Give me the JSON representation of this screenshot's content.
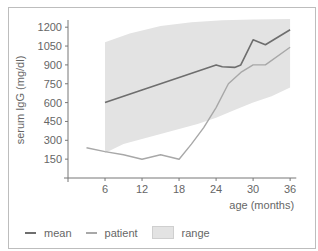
{
  "colors": {
    "mean": "#6e6e6e",
    "patient": "#a8a8a8",
    "range": "#e3e3e3",
    "axis": "#777777",
    "text": "#666666"
  },
  "chart_data": {
    "type": "line",
    "title": "",
    "xlabel": "age (months)",
    "ylabel": "serum IgG (mg/dl)",
    "xlim": [
      0,
      37
    ],
    "ylim": [
      0,
      1250
    ],
    "x_ticks": [
      6,
      12,
      18,
      24,
      30,
      36
    ],
    "y_ticks": [
      150,
      300,
      450,
      600,
      750,
      900,
      1050,
      1200
    ],
    "grid": false,
    "legend_position": "bottom",
    "series": [
      {
        "name": "mean",
        "type": "line",
        "points": [
          [
            6,
            600
          ],
          [
            12,
            700
          ],
          [
            18,
            800
          ],
          [
            24,
            900
          ],
          [
            25,
            885
          ],
          [
            27,
            880
          ],
          [
            28,
            900
          ],
          [
            30,
            1100
          ],
          [
            32,
            1060
          ],
          [
            36,
            1180
          ]
        ]
      },
      {
        "name": "patient",
        "type": "line",
        "points": [
          [
            3,
            240
          ],
          [
            6,
            210
          ],
          [
            9,
            185
          ],
          [
            12,
            150
          ],
          [
            15,
            185
          ],
          [
            18,
            150
          ],
          [
            20,
            270
          ],
          [
            22,
            400
          ],
          [
            24,
            560
          ],
          [
            26,
            750
          ],
          [
            28,
            840
          ],
          [
            30,
            900
          ],
          [
            32,
            900
          ],
          [
            36,
            1040
          ]
        ]
      },
      {
        "name": "range",
        "type": "area",
        "upper": [
          [
            6,
            1080
          ],
          [
            10,
            1150
          ],
          [
            15,
            1210
          ],
          [
            20,
            1240
          ],
          [
            25,
            1255
          ],
          [
            30,
            1262
          ],
          [
            36,
            1265
          ]
        ],
        "lower": [
          [
            6,
            200
          ],
          [
            9,
            270
          ],
          [
            12,
            310
          ],
          [
            15,
            350
          ],
          [
            18,
            390
          ],
          [
            21,
            430
          ],
          [
            24,
            480
          ],
          [
            27,
            540
          ],
          [
            30,
            600
          ],
          [
            33,
            650
          ],
          [
            36,
            720
          ]
        ]
      }
    ]
  },
  "legend": {
    "items": [
      {
        "label": "mean"
      },
      {
        "label": "patient"
      },
      {
        "label": "range"
      }
    ]
  }
}
